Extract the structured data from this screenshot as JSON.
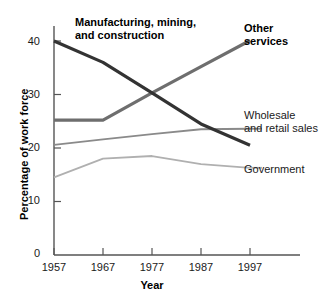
{
  "chart_data": {
    "type": "line",
    "title": "",
    "xlabel": "Year",
    "ylabel": "Percentage of work force",
    "x": [
      1957,
      1967,
      1977,
      1987,
      1997
    ],
    "categories": [
      "1957",
      "1967",
      "1977",
      "1987",
      "1997"
    ],
    "xlim": [
      1957,
      1997
    ],
    "ylim": [
      0,
      42
    ],
    "yticks": [
      0,
      10,
      20,
      30,
      40
    ],
    "ytick_labels": [
      "0",
      "10",
      "20",
      "30",
      "40"
    ],
    "xticks": [
      1957,
      1967,
      1977,
      1987,
      1997
    ],
    "xtick_labels": [
      "1957",
      "1967",
      "1977",
      "1987",
      "1997"
    ],
    "grid": false,
    "legend": "inline-annotations",
    "series": [
      {
        "name": "Manufacturing, mining, and construction",
        "label_lines": [
          "Manufacturing, mining,",
          "and construction"
        ],
        "values": [
          40.0,
          36.0,
          30.3,
          24.5,
          20.5
        ],
        "color": "#333333",
        "width": 3.2,
        "emphasis": "bold"
      },
      {
        "name": "Other services",
        "label_lines": [
          "Other",
          "services"
        ],
        "values": [
          25.2,
          25.2,
          30.3,
          35.2,
          40.1
        ],
        "color": "#6e6e6e",
        "width": 3.2,
        "emphasis": "bold"
      },
      {
        "name": "Wholesale and retail sales",
        "label_lines": [
          "Wholesale",
          "and retail sales"
        ],
        "values": [
          20.6,
          21.6,
          22.6,
          23.5,
          23.6
        ],
        "color": "#8a8a8a",
        "width": 1.8,
        "emphasis": "normal"
      },
      {
        "name": "Government",
        "label_lines": [
          "Government"
        ],
        "values": [
          14.5,
          18.0,
          18.5,
          17.0,
          16.3
        ],
        "color": "#b0b0b0",
        "width": 1.8,
        "emphasis": "normal"
      }
    ]
  },
  "axes": {
    "y_title": "Percentage of work force",
    "x_title": "Year",
    "axis_color": "#555555"
  },
  "ytick_values": [
    "40",
    "30",
    "20",
    "10",
    "0"
  ],
  "xtick_values": [
    "1957",
    "1967",
    "1977",
    "1987",
    "1997"
  ],
  "annotations": {
    "manufacturing_line1": "Manufacturing, mining,",
    "manufacturing_line2": "and construction",
    "other_line1": "Other",
    "other_line2": "services",
    "wholesale_line1": "Wholesale",
    "wholesale_line2": "and retail sales",
    "government_line1": "Government"
  }
}
